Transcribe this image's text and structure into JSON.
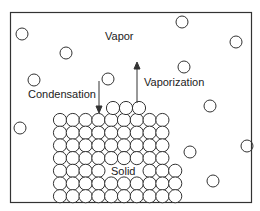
{
  "labels": {
    "vapor": "Vapor",
    "condensation": "Condensation",
    "vaporization": "Vaporization",
    "solid": "Solid"
  },
  "colors": {
    "stroke": "#333333",
    "background": "#ffffff"
  },
  "vapor_particles": [
    [
      22,
      34
    ],
    [
      66,
      53
    ],
    [
      34,
      80
    ],
    [
      108,
      79
    ],
    [
      182,
      22
    ],
    [
      236,
      42
    ],
    [
      184,
      67
    ],
    [
      210,
      106
    ],
    [
      20,
      128
    ],
    [
      247,
      146
    ],
    [
      190,
      152
    ],
    [
      213,
      181
    ]
  ]
}
